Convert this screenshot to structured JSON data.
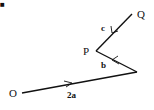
{
  "diagram": {
    "type": "vector-path",
    "points": {
      "O": {
        "label": "O",
        "x": 22,
        "y": 93
      },
      "R": {
        "label": "",
        "x": 137,
        "y": 72
      },
      "P": {
        "label": "P",
        "x": 96,
        "y": 51
      },
      "Q": {
        "label": "Q",
        "x": 132,
        "y": 14
      }
    },
    "vectors": [
      {
        "from": "O",
        "to": "R",
        "label": "2a"
      },
      {
        "from": "R",
        "to": "P",
        "label": "b"
      },
      {
        "from": "P",
        "to": "Q",
        "label": "c"
      }
    ],
    "corner_mark": "■",
    "line_color": "#111111"
  }
}
